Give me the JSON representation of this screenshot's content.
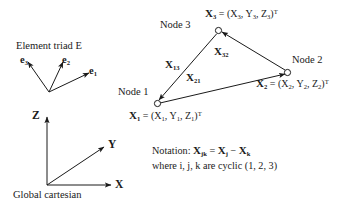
{
  "figure": {
    "triad": {
      "title": "Element triad E",
      "vectors": [
        {
          "name": "e3",
          "base": "e",
          "sub": "3"
        },
        {
          "name": "e2",
          "base": "e",
          "sub": "2"
        },
        {
          "name": "e1",
          "base": "e",
          "sub": "1"
        }
      ]
    },
    "global_frame": {
      "caption": "Global cartesian",
      "axes": [
        {
          "name": "Z",
          "label": "Z"
        },
        {
          "name": "Y",
          "label": "Y"
        },
        {
          "name": "X",
          "label": "X"
        }
      ]
    },
    "nodes": [
      {
        "id": "node1",
        "label": "Node 1",
        "vector_base": "X",
        "vector_sub": "1",
        "coord_expr": "(X",
        "comp_sub": "1",
        "coords": [
          {
            "base": "X",
            "sub": "1"
          },
          {
            "base": "Y",
            "sub": "1"
          },
          {
            "base": "Z",
            "sub": "1"
          }
        ],
        "transpose": "T"
      },
      {
        "id": "node2",
        "label": "Node 2",
        "vector_base": "X",
        "vector_sub": "2",
        "coords": [
          {
            "base": "X",
            "sub": "2"
          },
          {
            "base": "Y",
            "sub": "2"
          },
          {
            "base": "Z",
            "sub": "2"
          }
        ],
        "transpose": "T"
      },
      {
        "id": "node3",
        "label": "Node 3",
        "vector_base": "X",
        "vector_sub": "3",
        "coords": [
          {
            "base": "X",
            "sub": "3"
          },
          {
            "base": "Y",
            "sub": "3"
          },
          {
            "base": "Z",
            "sub": "3"
          }
        ],
        "transpose": "T"
      }
    ],
    "edges": [
      {
        "id": "edge13",
        "base": "X",
        "sub": "13",
        "from": "node3",
        "to": "node1"
      },
      {
        "id": "edge32",
        "base": "X",
        "sub": "32",
        "from": "node2",
        "to": "node3"
      },
      {
        "id": "edge21",
        "base": "X",
        "sub": "21",
        "from": "node1",
        "to": "node2"
      }
    ],
    "notation": {
      "line1_prefix": "Notation: ",
      "line1_lhs_base": "X",
      "line1_lhs_sub": "jk",
      "line1_eq": " = ",
      "line1_rhs1_base": "X",
      "line1_rhs1_sub": "j",
      "line1_minus": " − ",
      "line1_rhs2_base": "X",
      "line1_rhs2_sub": "k",
      "line2": "where i, j, k are cyclic (1, 2, 3)"
    },
    "equals": " = ",
    "comma": ", ",
    "open_paren": "(",
    "close_paren": ")",
    "colors": {
      "ink": "#1a1a1a",
      "background": "#ffffff"
    }
  }
}
